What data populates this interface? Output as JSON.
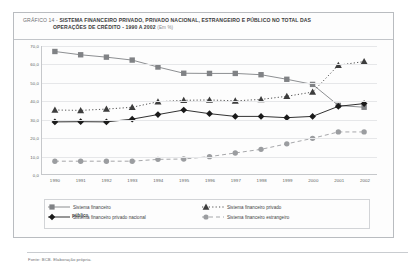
{
  "figure": {
    "label": "GRÁFICO 14 - ",
    "title_line1": "SISTEMA FINANCEIRO PRIVADO, PRIVADO NACIONAL, ESTRANGEIRO E PÚBLICO NO TOTAL DAS",
    "title_line2": "OPERAÇÕES DE CRÉDITO - 1990 A 2002",
    "unit": "(Em %)",
    "source": "Fonte: BCB. Elaboração própria."
  },
  "legend": {
    "items": [
      {
        "label": "Sistema financeiro",
        "marker": "square",
        "line": "solid",
        "color": "#808285"
      },
      {
        "label": "Sistema financeiro privado nacional",
        "marker": "diamond",
        "line": "solid",
        "color": "#1a1a1a"
      },
      {
        "label": "Sistema financeiro privado",
        "marker": "triangle",
        "line": "dotted",
        "color": "#3d3d3d"
      },
      {
        "label": "Sistema financeiro estrangeiro",
        "marker": "circle",
        "line": "dashed",
        "color": "#9b9da0"
      }
    ],
    "overlap_text": "público"
  },
  "chart_data": {
    "type": "line",
    "title": "GRÁFICO 14 - SISTEMA FINANCEIRO PRIVADO, PRIVADO NACIONAL, ESTRANGEIRO E PÚBLICO NO TOTAL DAS OPERAÇÕES DE CRÉDITO - 1990 A 2002 (Em %)",
    "xlabel": "",
    "ylabel": "",
    "ylim": [
      0,
      70
    ],
    "ytick_labels": [
      "0,0",
      "10,0",
      "20,0",
      "30,0",
      "40,0",
      "50,0",
      "60,0",
      "70,0"
    ],
    "ytick_values": [
      0,
      10,
      20,
      30,
      40,
      50,
      60,
      70
    ],
    "grid": true,
    "legend_position": "bottom",
    "categories": [
      "1990",
      "1991",
      "1992",
      "1993",
      "1994",
      "1995",
      "1996",
      "1997",
      "1998",
      "1999",
      "2000",
      "2001",
      "2002"
    ],
    "series": [
      {
        "name": "Sistema financeiro público",
        "marker": "square",
        "line": "solid",
        "color": "#808285",
        "values": [
          67.0,
          65.2,
          63.9,
          62.3,
          58.5,
          55.1,
          55.0,
          55.0,
          54.3,
          51.8,
          49.0,
          37.5,
          36.5
        ]
      },
      {
        "name": "Sistema financeiro privado",
        "marker": "triangle",
        "line": "dotted",
        "color": "#3d3d3d",
        "values": [
          35.0,
          34.8,
          35.5,
          36.5,
          39.5,
          40.3,
          40.5,
          40.0,
          40.8,
          42.5,
          44.8,
          59.5,
          61.5
        ]
      },
      {
        "name": "Sistema financeiro privado nacional",
        "marker": "diamond",
        "line": "solid",
        "color": "#1a1a1a",
        "values": [
          28.5,
          28.6,
          28.5,
          30.0,
          32.5,
          35.0,
          33.0,
          31.5,
          31.5,
          30.8,
          31.5,
          37.0,
          38.5
        ]
      },
      {
        "name": "Sistema financeiro estrangeiro",
        "marker": "circle",
        "line": "dashed",
        "color": "#9b9da0",
        "values": [
          7.0,
          7.0,
          7.0,
          7.0,
          8.0,
          8.2,
          9.5,
          11.5,
          13.5,
          16.5,
          19.5,
          23.0,
          23.0
        ]
      }
    ]
  }
}
